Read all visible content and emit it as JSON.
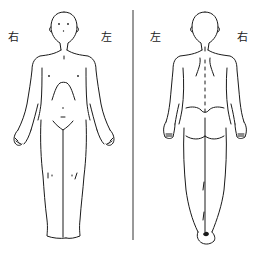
{
  "diagram": {
    "type": "body-chart",
    "views": [
      {
        "id": "front",
        "name": "Front view",
        "labels": {
          "viewer_left": "右",
          "viewer_right": "左"
        }
      },
      {
        "id": "back",
        "name": "Back view",
        "labels": {
          "viewer_left": "左",
          "viewer_right": "右"
        }
      }
    ],
    "colors": {
      "background": "#ffffff",
      "ink": "#1a1a1a",
      "divider": "#333333"
    }
  }
}
